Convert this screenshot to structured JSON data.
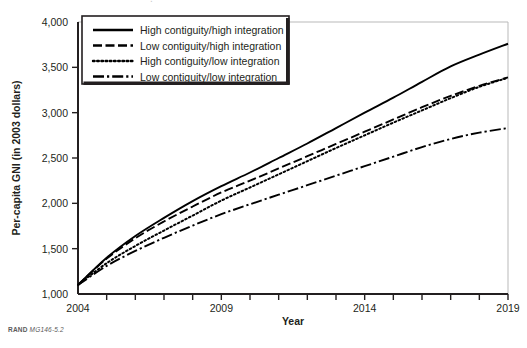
{
  "figure": {
    "note_prefix": "RAND",
    "note_id": "MG146-5.2",
    "background": "#ffffff",
    "ink": "#231f20"
  },
  "chart_data": {
    "type": "line",
    "title": "",
    "xlabel": "Year",
    "ylabel": "Per-capita GNI (in 2003 dollars)",
    "xlim": [
      2004,
      2019
    ],
    "ylim": [
      1000,
      4000
    ],
    "xticks": [
      2004,
      2005,
      2006,
      2007,
      2008,
      2009,
      2010,
      2011,
      2012,
      2013,
      2014,
      2015,
      2016,
      2017,
      2018,
      2019
    ],
    "xticklabels": [
      "2004",
      "",
      "",
      "",
      "",
      "2009",
      "",
      "",
      "",
      "",
      "2014",
      "",
      "",
      "",
      "",
      "2019"
    ],
    "yticks": [
      1000,
      1500,
      2000,
      2500,
      3000,
      3500,
      4000
    ],
    "yticklabels": [
      "1,000",
      "1,500",
      "2,000",
      "2,500",
      "3,000",
      "3,500",
      "4,000"
    ],
    "grid": false,
    "legend_position": "top-left",
    "x": [
      2004,
      2005,
      2006,
      2007,
      2008,
      2009,
      2010,
      2011,
      2012,
      2013,
      2014,
      2015,
      2016,
      2017,
      2018,
      2019
    ],
    "series": [
      {
        "name": "High contiguity/high integration",
        "dash": "solid",
        "color": "#000000",
        "values": [
          1100,
          1400,
          1640,
          1840,
          2025,
          2190,
          2340,
          2500,
          2660,
          2830,
          3000,
          3165,
          3340,
          3510,
          3640,
          3760
        ]
      },
      {
        "name": "Low contiguity/high integration",
        "dash": "dashed",
        "color": "#000000",
        "values": [
          1100,
          1390,
          1615,
          1800,
          1965,
          2120,
          2250,
          2385,
          2520,
          2655,
          2790,
          2925,
          3060,
          3185,
          3295,
          3390
        ]
      },
      {
        "name": "High contiguity/low integration",
        "dash": "dotted",
        "color": "#000000",
        "values": [
          1100,
          1340,
          1530,
          1700,
          1865,
          2030,
          2175,
          2320,
          2465,
          2610,
          2750,
          2890,
          3025,
          3160,
          3285,
          3385
        ]
      },
      {
        "name": "Low contiguity/low integration",
        "dash": "dashdot",
        "color": "#000000",
        "values": [
          1100,
          1310,
          1475,
          1620,
          1755,
          1880,
          1990,
          2095,
          2200,
          2305,
          2410,
          2515,
          2620,
          2710,
          2780,
          2830
        ]
      }
    ]
  }
}
